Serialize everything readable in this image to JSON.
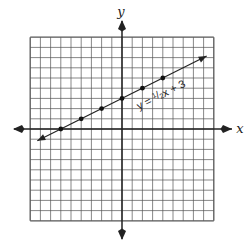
{
  "chart_data": {
    "type": "line",
    "title": "",
    "xlabel": "x",
    "ylabel": "y",
    "xlim": [
      -9,
      9
    ],
    "ylim": [
      -9,
      9
    ],
    "grid": true,
    "grid_step": 1,
    "legend": "none",
    "series": [
      {
        "name": "y = 1/2x + 3",
        "equation": {
          "slope": 0.5,
          "intercept": 3
        },
        "line_extent_x": [
          -8.3,
          8.3
        ],
        "arrows": "both",
        "points": [
          {
            "x": -6,
            "y": 0
          },
          {
            "x": -4,
            "y": 1
          },
          {
            "x": -2,
            "y": 2
          },
          {
            "x": 0,
            "y": 3
          },
          {
            "x": 2,
            "y": 4
          },
          {
            "x": 4,
            "y": 5
          }
        ]
      }
    ],
    "annotations": [
      {
        "text": "y = ½x + 3",
        "parts": [
          "y = ",
          "1",
          "/",
          "2",
          "x + 3"
        ],
        "rotation_deg": -26.6
      }
    ]
  },
  "labels": {
    "x_axis": "x",
    "y_axis": "y",
    "equation_prefix": "y = ",
    "equation_num": "1",
    "equation_slash": "/",
    "equation_den": "2",
    "equation_suffix": "x + 3"
  },
  "colors": {
    "grid": "#555555",
    "axis": "#222222",
    "line": "#222222",
    "point": "#111111",
    "background": "#ffffff"
  }
}
